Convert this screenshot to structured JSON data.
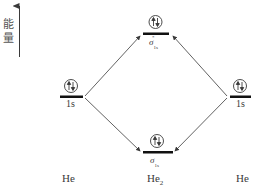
{
  "axis": {
    "label_line1": "能",
    "label_line2": "量",
    "direction": "up"
  },
  "levels": {
    "left_atom": {
      "label": "1s",
      "electrons": "↑↓"
    },
    "right_atom": {
      "label": "1s",
      "electrons": "↑↓"
    },
    "antibonding": {
      "symbol": "σ",
      "sub": "1s",
      "sup": "*",
      "electrons": "↑↓"
    },
    "bonding": {
      "symbol": "σ",
      "sub": "1s",
      "electrons": "↑↓"
    }
  },
  "species": {
    "left": "He",
    "center_base": "He",
    "center_sub": "2",
    "right": "He"
  },
  "colors": {
    "line": "#3a3a3a",
    "level_bar": "#111111",
    "text": "#3a3a3a"
  }
}
